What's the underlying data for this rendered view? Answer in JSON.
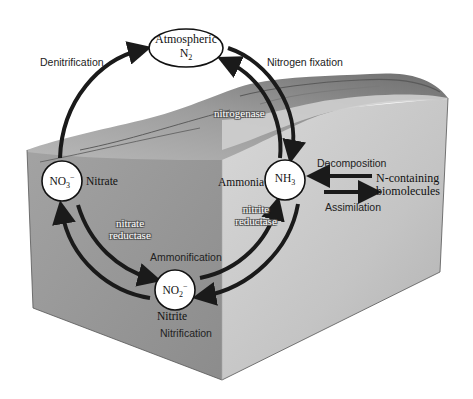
{
  "diagram": {
    "nodes": {
      "n2": {
        "line1": "Atmospheric",
        "line2_main": "N",
        "line2_sub": "2"
      },
      "no3": {
        "main": "NO",
        "sub": "3",
        "sup": "−",
        "label": "Nitrate"
      },
      "nh3": {
        "main": "NH",
        "sub": "3",
        "label": "Ammonia"
      },
      "no2": {
        "main": "NO",
        "sub": "2",
        "sup": "−",
        "label": "Nitrite"
      },
      "bio": {
        "line1": "N-containing",
        "line2": "biomolecules"
      }
    },
    "processes": {
      "denitrification": "Denitrification",
      "nitrogen_fixation": "Nitrogen fixation",
      "decomposition": "Decomposition",
      "assimilation": "Assimilation",
      "ammonification": "Ammonification",
      "nitrification": "Nitrification"
    },
    "enzymes": {
      "nitrogenase": "nitrogenase",
      "nitrate_reductase_1": "nitrate",
      "nitrate_reductase_2": "reductase",
      "nitrite_reductase_1": "nitrite",
      "nitrite_reductase_2": "reductase"
    },
    "colors": {
      "arrow": "#1a1a1a",
      "block_left": "#9a9a9a",
      "block_right": "#c8c8c8",
      "terrain": "#8a8a8a"
    }
  }
}
